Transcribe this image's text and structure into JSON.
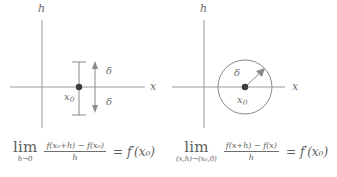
{
  "figure": {
    "background_color": "#ffffff",
    "ink_color": "#6a6a6a",
    "panels": [
      {
        "id": "left",
        "diagram": {
          "vertical_axis_label": "h",
          "horizontal_axis_label": "x",
          "point_label": "x",
          "point_subscript": "0",
          "delta_label_up": "δ",
          "delta_label_down": "δ",
          "description": "vertical delta interval at x0 on the x-axis"
        },
        "formula": {
          "limit_operator": "lim",
          "limit_subscript": "h→0",
          "numerator": "f(x₀+h) − f(x₀)",
          "denominator": "h",
          "equals": "=",
          "right_side": "f′(x₀)"
        }
      },
      {
        "id": "right",
        "diagram": {
          "vertical_axis_label": "h",
          "horizontal_axis_label": "x",
          "point_label": "x",
          "point_subscript": "0",
          "delta_label": "δ",
          "description": "circle of radius delta centred at (x0, 0)"
        },
        "formula": {
          "limit_operator": "lim",
          "limit_subscript": "(x,h)→(x₀,0)",
          "numerator": "f(x+h) − f(x)",
          "denominator": "h",
          "equals": "=",
          "right_side": "f′(x₀)"
        }
      }
    ]
  }
}
